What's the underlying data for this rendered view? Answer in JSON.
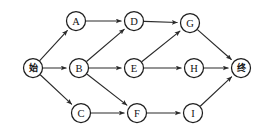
{
  "diagram": {
    "background_color": "#ffffff",
    "node_stroke_color": "#1e1e1e",
    "node_fill_color": "#ffffff",
    "edge_color": "#2b2b2b",
    "label_color": "#111111",
    "node_radius": 9.5,
    "nodes": [
      {
        "id": "start",
        "label": "始",
        "cjk": true,
        "x": 33,
        "y": 68
      },
      {
        "id": "A",
        "label": "A",
        "cjk": false,
        "x": 76,
        "y": 21
      },
      {
        "id": "B",
        "label": "B",
        "cjk": false,
        "x": 79,
        "y": 68
      },
      {
        "id": "C",
        "label": "C",
        "cjk": false,
        "x": 81,
        "y": 113
      },
      {
        "id": "D",
        "label": "D",
        "cjk": false,
        "x": 134,
        "y": 21
      },
      {
        "id": "E",
        "label": "E",
        "cjk": false,
        "x": 134,
        "y": 68
      },
      {
        "id": "F",
        "label": "F",
        "cjk": false,
        "x": 137,
        "y": 113
      },
      {
        "id": "G",
        "label": "G",
        "cjk": false,
        "x": 190,
        "y": 23
      },
      {
        "id": "H",
        "label": "H",
        "cjk": false,
        "x": 194,
        "y": 68
      },
      {
        "id": "I",
        "label": "I",
        "cjk": false,
        "x": 193,
        "y": 113
      },
      {
        "id": "end",
        "label": "终",
        "cjk": true,
        "x": 241,
        "y": 68
      }
    ],
    "edges": [
      {
        "from": "start",
        "to": "A"
      },
      {
        "from": "start",
        "to": "B"
      },
      {
        "from": "start",
        "to": "C"
      },
      {
        "from": "A",
        "to": "D"
      },
      {
        "from": "B",
        "to": "D"
      },
      {
        "from": "B",
        "to": "E"
      },
      {
        "from": "B",
        "to": "F"
      },
      {
        "from": "C",
        "to": "F"
      },
      {
        "from": "D",
        "to": "G"
      },
      {
        "from": "E",
        "to": "G"
      },
      {
        "from": "E",
        "to": "H"
      },
      {
        "from": "F",
        "to": "I"
      },
      {
        "from": "G",
        "to": "end"
      },
      {
        "from": "H",
        "to": "end"
      },
      {
        "from": "I",
        "to": "end"
      }
    ]
  }
}
